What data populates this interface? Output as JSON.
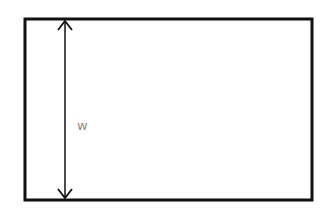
{
  "diagram": {
    "type": "rectangle-dimension",
    "rectangle": {
      "x": 25,
      "y": 19,
      "width": 287,
      "height": 181,
      "stroke": "#111111"
    },
    "dimension": {
      "label": "w",
      "orientation": "vertical",
      "x": 65,
      "y1": 19,
      "y2": 200
    },
    "colors": {
      "stroke": "#111111",
      "label": "#8a8a8a"
    }
  }
}
